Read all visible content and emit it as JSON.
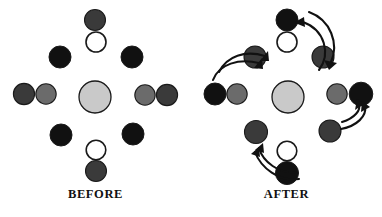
{
  "figure": {
    "title_before": "BEFORE",
    "title_after": "AFTER",
    "background": "#ffffff",
    "colors": {
      "black": "#111111",
      "dark_gray": "#3a3a3a",
      "medium_gray": "#6b6b6b",
      "light_gray": "#c9c9c9",
      "white": "#ffffff",
      "outline": "#1a1a1a",
      "arrow": "#111111",
      "label_text": "#111111"
    },
    "panels": [
      {
        "id": "before",
        "label": "BEFORE",
        "disks": [
          {
            "name": "center",
            "cx": 95,
            "cy": 97,
            "r": 16.0,
            "fill": "#c9c9c9",
            "stroke_width": 1.3
          },
          {
            "name": "top-outer",
            "cx": 95,
            "cy": 20,
            "r": 10.5,
            "fill": "#3a3a3a",
            "stroke_width": 1.1
          },
          {
            "name": "top-inner",
            "cx": 96,
            "cy": 42,
            "r": 10.0,
            "fill": "#ffffff",
            "stroke_width": 1.6
          },
          {
            "name": "bottom-inner",
            "cx": 96,
            "cy": 150,
            "r": 9.8,
            "fill": "#ffffff",
            "stroke_width": 1.6
          },
          {
            "name": "bottom-outer",
            "cx": 96,
            "cy": 171,
            "r": 10.5,
            "fill": "#3a3a3a",
            "stroke_width": 1.1
          },
          {
            "name": "left-outer",
            "cx": 24,
            "cy": 94,
            "r": 10.6,
            "fill": "#3a3a3a",
            "stroke_width": 1.1
          },
          {
            "name": "left-inner",
            "cx": 46,
            "cy": 94,
            "r": 10.2,
            "fill": "#6b6b6b",
            "stroke_width": 1.1
          },
          {
            "name": "right-inner",
            "cx": 145,
            "cy": 95,
            "r": 10.2,
            "fill": "#6b6b6b",
            "stroke_width": 1.1
          },
          {
            "name": "right-outer",
            "cx": 167,
            "cy": 95,
            "r": 10.6,
            "fill": "#3a3a3a",
            "stroke_width": 1.1
          },
          {
            "name": "diag-top-left",
            "cx": 60,
            "cy": 57,
            "r": 11.0,
            "fill": "#111111",
            "stroke_width": 1.0
          },
          {
            "name": "diag-top-right",
            "cx": 132,
            "cy": 57,
            "r": 11.0,
            "fill": "#111111",
            "stroke_width": 1.0
          },
          {
            "name": "diag-bottom-left",
            "cx": 61,
            "cy": 135,
            "r": 11.0,
            "fill": "#111111",
            "stroke_width": 1.0
          },
          {
            "name": "diag-bottom-right",
            "cx": 133,
            "cy": 134,
            "r": 11.0,
            "fill": "#111111",
            "stroke_width": 1.0
          }
        ],
        "arrows": []
      },
      {
        "id": "after",
        "label": "AFTER",
        "disks": [
          {
            "name": "center",
            "cx": 97,
            "cy": 97,
            "r": 16.0,
            "fill": "#c9c9c9",
            "stroke_width": 1.3
          },
          {
            "name": "top-outer",
            "cx": 96,
            "cy": 20,
            "r": 11.0,
            "fill": "#111111",
            "stroke_width": 1.0
          },
          {
            "name": "top-inner",
            "cx": 96,
            "cy": 42,
            "r": 10.0,
            "fill": "#ffffff",
            "stroke_width": 1.6
          },
          {
            "name": "bottom-inner",
            "cx": 96,
            "cy": 151,
            "r": 9.8,
            "fill": "#ffffff",
            "stroke_width": 1.6
          },
          {
            "name": "bottom-outer",
            "cx": 96,
            "cy": 173,
            "r": 11.5,
            "fill": "#111111",
            "stroke_width": 1.0
          },
          {
            "name": "left-outer",
            "cx": 24,
            "cy": 94,
            "r": 11.0,
            "fill": "#111111",
            "stroke_width": 1.0
          },
          {
            "name": "left-inner",
            "cx": 46,
            "cy": 94,
            "r": 10.2,
            "fill": "#6b6b6b",
            "stroke_width": 1.1
          },
          {
            "name": "right-inner",
            "cx": 146,
            "cy": 94,
            "r": 10.2,
            "fill": "#6b6b6b",
            "stroke_width": 1.1
          },
          {
            "name": "right-outer",
            "cx": 170,
            "cy": 94,
            "r": 11.8,
            "fill": "#111111",
            "stroke_width": 1.0
          },
          {
            "name": "diag-top-left",
            "cx": 64,
            "cy": 57,
            "r": 11.0,
            "fill": "#3a3a3a",
            "stroke_width": 1.1
          },
          {
            "name": "diag-top-right",
            "cx": 132,
            "cy": 57,
            "r": 11.0,
            "fill": "#3a3a3a",
            "stroke_width": 1.1
          },
          {
            "name": "diag-bottom-left",
            "cx": 65,
            "cy": 132,
            "r": 11.5,
            "fill": "#3a3a3a",
            "stroke_width": 1.1
          },
          {
            "name": "diag-bottom-right",
            "cx": 139,
            "cy": 131,
            "r": 11.0,
            "fill": "#3a3a3a",
            "stroke_width": 1.1
          }
        ],
        "arrows": [
          {
            "name": "arrow-top-right-to-top",
            "d": "M 128 70 C 140 54 134 30 112 22",
            "head": "113,17 103,22.5 114,27"
          },
          {
            "name": "arrow-top-to-top-right",
            "d": "M 118 12 C 140 20 148 44 140 62",
            "head": "146,63 138,70 133,60"
          },
          {
            "name": "arrow-upper-left-pair-a",
            "d": "M 28 72 C 36 56 54 50 74 56",
            "head": "77,51 78,61 69,61"
          },
          {
            "name": "arrow-upper-left-pair-b",
            "d": "M 22 80 C 28 64 48 58 68 63",
            "head": "71,58 72,69 63,68"
          },
          {
            "name": "arrow-right-lower-a",
            "d": "M 151 122 C 164 118 170 110 168 104",
            "head": "173,104 164,110 166,99"
          },
          {
            "name": "arrow-right-lower-b",
            "d": "M 150 129 C 166 126 176 116 174 106",
            "head": "179,107 170,112 171,101"
          },
          {
            "name": "arrow-bottom-left-a",
            "d": "M 105 172 C 88 174 72 162 68 148",
            "head": "64,150 72,143 73,153"
          },
          {
            "name": "arrow-bottom-left-b",
            "d": "M 108 179 C 88 182 70 168 64 152",
            "head": "60,154 68,147 69,157"
          }
        ]
      }
    ]
  }
}
